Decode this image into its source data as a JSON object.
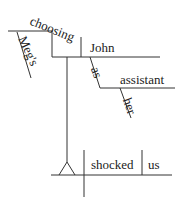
{
  "diagram": {
    "type": "reed-kellogg-sentence-diagram",
    "words": {
      "gerund": "choosing",
      "gerund_modifier": "Meg's",
      "gerund_object": "John",
      "complement_marker": "as",
      "complement": "assistant",
      "complement_modifier": "her",
      "verb": "shocked",
      "object": "us"
    },
    "line_color": "#333333"
  }
}
